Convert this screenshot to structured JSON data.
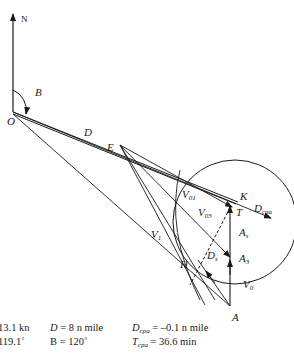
{
  "diagram": {
    "labels": {
      "north": "N",
      "bearing_angle": "B",
      "origin": "O",
      "distance": "D",
      "point_e": "E",
      "v01": "V",
      "v01_sub": "01",
      "v03": "V",
      "v03_sub": "03",
      "v1": "V",
      "v1_sub": "1",
      "k": "K",
      "t": "T",
      "dcpa": "D",
      "dcpa_sub": "cpa",
      "as": "A",
      "as_sub": "s",
      "ds": "D",
      "ds_sub": "s",
      "a3": "A",
      "a3_sub": "3",
      "h": "H",
      "v0": "V",
      "v0_sub": "0",
      "a": "A"
    },
    "colors": {
      "line": "#1a1a1a",
      "background": "#ffffff"
    }
  },
  "parameters": {
    "col1": {
      "row1": "13.1 kn",
      "row2": "119.1˚"
    },
    "col2": {
      "row1_var": "D",
      "row1_rest": " = 8 n mile",
      "row2": "B = 120˚"
    },
    "col3": {
      "row1_var": "D",
      "row1_sub": "cpa",
      "row1_rest": " = –0.1 n mile",
      "row2_var": "T",
      "row2_sub": "cpa",
      "row2_rest": " = 36.6 min"
    }
  }
}
